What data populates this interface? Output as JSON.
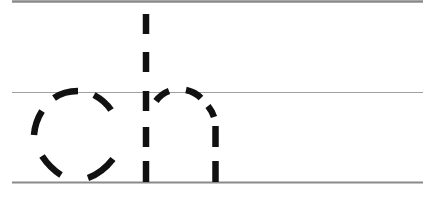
{
  "worksheet": {
    "letters": "ch",
    "letter_items": [
      {
        "char": "c",
        "style": "dashed-tracing"
      },
      {
        "char": "h",
        "style": "dashed-tracing"
      }
    ]
  },
  "colors": {
    "background": "#ffffff",
    "stroke": "#111111",
    "top_line": "#8a8a8a",
    "mid_line": "#a0a0a0",
    "base_line": "#8a8a8a"
  }
}
